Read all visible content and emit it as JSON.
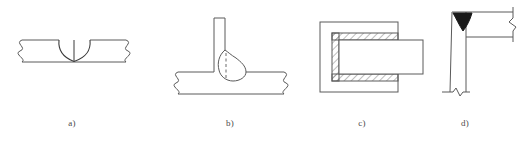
{
  "figure": {
    "background_color": "#ffffff",
    "line_color": "#5a5a5a",
    "weld_fill_color": "#1a1a1a",
    "label_color": "#4a4a4a",
    "width": 527,
    "height": 143
  },
  "panels": [
    {
      "id": "a",
      "label": "a)",
      "label_x": 72,
      "label_y": 120,
      "name": "butt-joint-double-v-groove",
      "description": "Butt joint in a flat plate shown in section with a double-V (X) groove weld at mid-span; both plate ends terminate in conventional break symbols.",
      "elements": [
        "horizontal-plate",
        "left-break-symbol",
        "right-break-symbol",
        "v-groove-weld-left-arc",
        "v-groove-weld-right-arc",
        "weld-centre-line"
      ]
    },
    {
      "id": "b",
      "label": "b)",
      "label_x": 230,
      "label_y": 120,
      "name": "tee-joint-fillet-weld",
      "description": "T-joint: a vertical plate standing on a horizontal plate with a single rounded fillet weld bead on the right side; the fusion boundary inside the bead is drawn as a dashed line.",
      "elements": [
        "vertical-plate",
        "horizontal-plate",
        "left-break-symbol",
        "right-break-symbol",
        "fillet-weld-bead",
        "weld-fusion-dashed-line"
      ]
    },
    {
      "id": "c",
      "label": "c)",
      "label_x": 362,
      "label_y": 120,
      "name": "socket-joint-hatched-weld",
      "description": "Plan/section of a socket or slot joint: a rectangular member receives an inserted bar; the U-shaped gap between them is filled with weld metal indicated by diagonal section hatching.",
      "elements": [
        "outer-member-rectangle",
        "inserted-bar-rectangle",
        "hatched-weld-channel"
      ]
    },
    {
      "id": "d",
      "label": "d)",
      "label_x": 465,
      "label_y": 120,
      "name": "corner-joint-filled-weld",
      "description": "Corner joint between a vertical column and a horizontal member, with the weld shown as a solid blackened fillet at the inside corner; member ends carry break symbols.",
      "elements": [
        "vertical-member",
        "horizontal-member-top-flange",
        "horizontal-member-bottom-flange",
        "corner-fillet-weld-filled",
        "right-break-line",
        "bottom-break-line"
      ]
    }
  ]
}
